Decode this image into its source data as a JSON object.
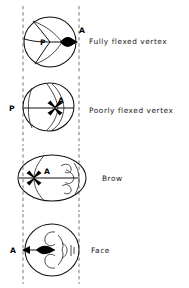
{
  "figure": {
    "background_color": "#ffffff",
    "ink_color": "#111111",
    "canal_line_color": "#555555",
    "width": 189,
    "height": 288
  },
  "birth_canal": {
    "name": "birth-canal-guide-lines",
    "style": "dashed vertical",
    "left_x": 23,
    "right_x": 79
  },
  "rows": [
    {
      "id": "fully-flexed-vertex",
      "caption": "Fully flexed vertex",
      "shape": "circle",
      "presenting_diameter_label": "A",
      "posterior_label": "P",
      "anterior_label": "A",
      "has_face": false,
      "suture_pattern": "y-shaped-lambdoid",
      "caption_x": 89,
      "caption_y": 41
    },
    {
      "id": "poorly-flexed-vertex",
      "caption": "Poorly flexed vertex",
      "shape": "ovoid",
      "presenting_diameter_label": "A",
      "posterior_label": "P",
      "anterior_label": "A",
      "has_face": false,
      "suture_pattern": "star-anterior-fontanelle",
      "caption_x": 89,
      "caption_y": 111
    },
    {
      "id": "brow",
      "caption": "Brow",
      "shape": "wide-ellipse",
      "presenting_diameter_label": "A",
      "posterior_label": "",
      "anterior_label": "A",
      "has_face": true,
      "suture_pattern": "star-left-of-centre",
      "caption_x": 102,
      "caption_y": 178
    },
    {
      "id": "face",
      "caption": "Face",
      "shape": "circle",
      "presenting_diameter_label": "A",
      "posterior_label": "",
      "anterior_label": "A",
      "has_face": true,
      "suture_pattern": "none",
      "caption_x": 91,
      "caption_y": 251
    }
  ],
  "markers": {
    "fontanelle_star": "dark-star-fontanelle",
    "arrowhead": "presenting-point-arrow"
  }
}
